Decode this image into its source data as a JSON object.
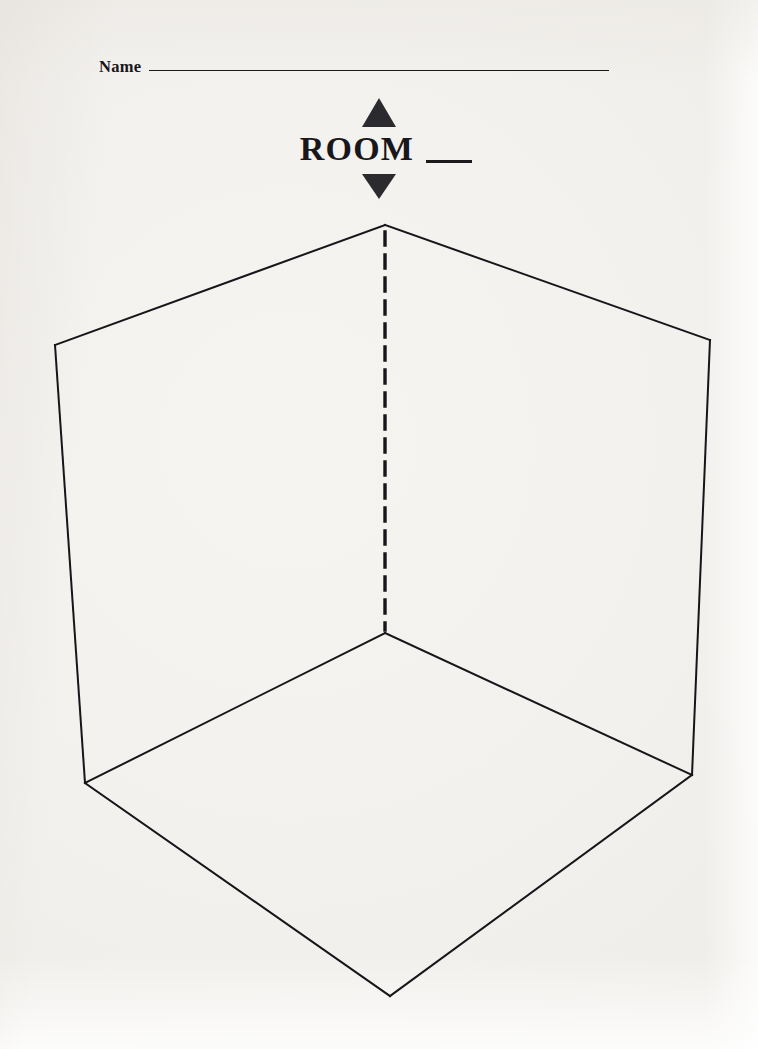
{
  "document": {
    "type": "worksheet",
    "page_background": "#f2f0ec",
    "ink_color": "#1b191c"
  },
  "name_field": {
    "label": "Name",
    "value": "",
    "placeholder": "",
    "rule_width_px": 460
  },
  "heading": {
    "title": "ROOM",
    "number_blank": "",
    "blank_rule_width_px": 46,
    "marker_up_icon": "triangle-up-icon",
    "marker_down_icon": "triangle-down-icon"
  },
  "diagram": {
    "name": "room-corner-perspective",
    "stroke_color": "#17151a",
    "stroke_width": 2,
    "dashed_stroke_width": 3.4,
    "dash_pattern": "13 10",
    "points": {
      "apex_top": [
        385,
        225
      ],
      "left_wall_top": [
        55,
        345
      ],
      "right_wall_top": [
        710,
        340
      ],
      "left_wall_bottom": [
        85,
        783
      ],
      "right_wall_bottom": [
        692,
        775
      ],
      "floor_inner_corner": [
        385,
        633
      ],
      "floor_front_apex": [
        390,
        996
      ]
    },
    "edges": [
      {
        "name": "ceiling-left-edge",
        "from": "apex_top",
        "to": "left_wall_top",
        "style": "solid"
      },
      {
        "name": "ceiling-right-edge",
        "from": "apex_top",
        "to": "right_wall_top",
        "style": "solid"
      },
      {
        "name": "left-wall-outer-edge",
        "from": "left_wall_top",
        "to": "left_wall_bottom",
        "style": "solid"
      },
      {
        "name": "right-wall-outer-edge",
        "from": "right_wall_top",
        "to": "right_wall_bottom",
        "style": "solid"
      },
      {
        "name": "wall-corner-seam",
        "from": "apex_top",
        "to": "floor_inner_corner",
        "style": "dashed"
      },
      {
        "name": "floor-left-baseboard",
        "from": "floor_inner_corner",
        "to": "left_wall_bottom",
        "style": "solid"
      },
      {
        "name": "floor-right-baseboard",
        "from": "floor_inner_corner",
        "to": "right_wall_bottom",
        "style": "solid"
      },
      {
        "name": "floor-front-left-edge",
        "from": "left_wall_bottom",
        "to": "floor_front_apex",
        "style": "solid"
      },
      {
        "name": "floor-front-right-edge",
        "from": "right_wall_bottom",
        "to": "floor_front_apex",
        "style": "solid"
      }
    ]
  }
}
